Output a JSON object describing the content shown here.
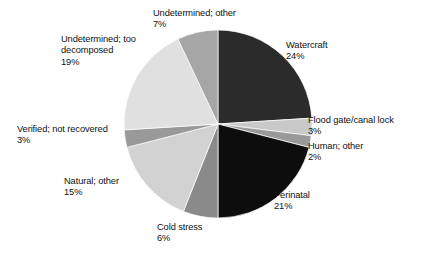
{
  "chart_data": {
    "type": "pie",
    "title": "",
    "subtitle": "",
    "xlabel": "",
    "ylabel": "",
    "legend_position": "none",
    "grid": false,
    "labels_outside": true,
    "start_angle_deg": 0,
    "direction": "clockwise",
    "total_percent": 100,
    "categories": [
      "Watercraft",
      "Flood gate/canal lock",
      "Human; other",
      "Perinatal",
      "Cold stress",
      "Natural; other",
      "Verified; not recovered",
      "Undetermined; too decomposed",
      "Undetermined; other"
    ],
    "values": [
      24,
      3,
      2,
      21,
      6,
      15,
      3,
      19,
      7
    ],
    "value_labels": [
      "24%",
      "3%",
      "2%",
      "21%",
      "6%",
      "15%",
      "3%",
      "19%",
      "7%"
    ],
    "slice_colors": [
      "#2b2b2b",
      "#c9c9c9",
      "#999999",
      "#0d0d0d",
      "#8a8a8a",
      "#d2d2d2",
      "#999999",
      "#e0e0e0",
      "#a6a6a6"
    ],
    "slices": [
      {
        "name": "Watercraft",
        "value": 24,
        "value_label": "24%",
        "color": "#2b2b2b"
      },
      {
        "name": "Flood gate/canal lock",
        "value": 3,
        "value_label": "3%",
        "color": "#c9c9c9"
      },
      {
        "name": "Human; other",
        "value": 2,
        "value_label": "2%",
        "color": "#999999"
      },
      {
        "name": "Perinatal",
        "value": 21,
        "value_label": "21%",
        "color": "#0d0d0d"
      },
      {
        "name": "Cold stress",
        "value": 6,
        "value_label": "6%",
        "color": "#8a8a8a"
      },
      {
        "name": "Natural; other",
        "value": 15,
        "value_label": "15%",
        "color": "#d2d2d2"
      },
      {
        "name": "Verified; not recovered",
        "value": 3,
        "value_label": "3%",
        "color": "#999999"
      },
      {
        "name": "Undetermined; too decomposed",
        "value": 19,
        "value_label": "19%",
        "color": "#e0e0e0"
      },
      {
        "name": "Undetermined; other",
        "value": 7,
        "value_label": "7%",
        "color": "#a6a6a6"
      }
    ]
  },
  "labels": {
    "watercraft": {
      "name": "Watercraft",
      "pct": "24%"
    },
    "floodgate": {
      "name": "Flood gate/canal lock",
      "pct": "3%"
    },
    "human": {
      "name": "Human; other",
      "pct": "2%"
    },
    "perinatal": {
      "name": "Perinatal",
      "pct": "21%"
    },
    "coldstress": {
      "name": "Cold stress",
      "pct": "6%"
    },
    "natural": {
      "name": "Natural; other",
      "pct": "15%"
    },
    "verified": {
      "name": "Verified; not recovered",
      "pct": "3%"
    },
    "toodecomposed": {
      "name": "Undetermined; too\ndecomposed",
      "pct": "19%"
    },
    "undetermined_other": {
      "name": "Undetermined; other",
      "pct": "7%"
    }
  },
  "style": {
    "background": "#ffffff",
    "text_color": "#111111",
    "slice_outline": "#ffffff"
  }
}
